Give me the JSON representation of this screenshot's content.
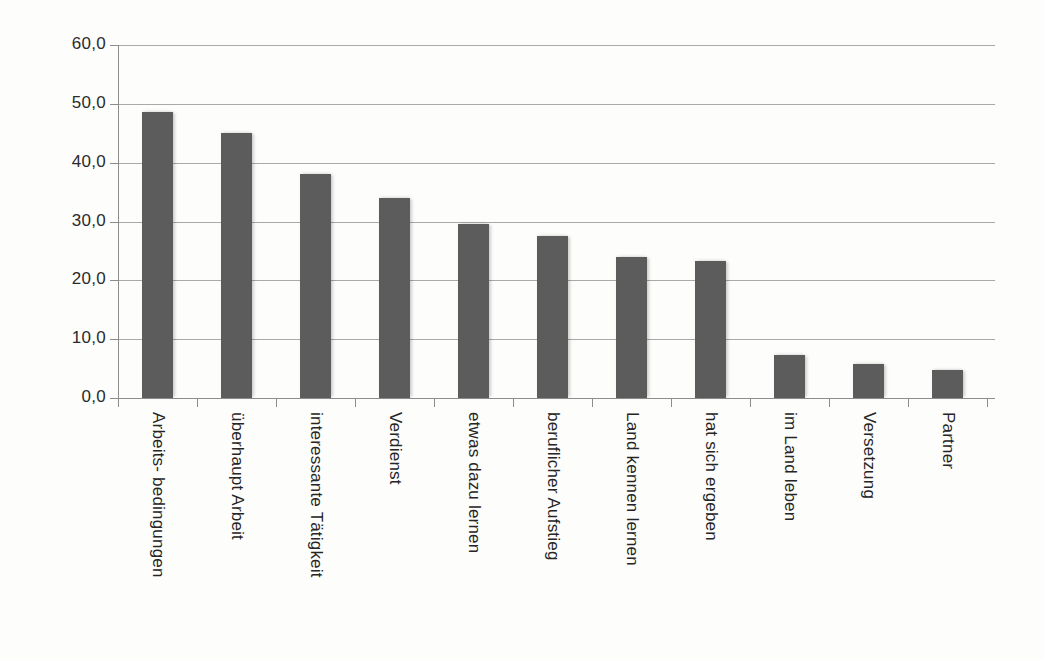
{
  "chart_data": {
    "type": "bar",
    "title": "",
    "subtitle": "",
    "xlabel": "",
    "ylabel": "",
    "ylim": [
      0,
      60
    ],
    "ytick_labels": [
      "0,0",
      "10,0",
      "20,0",
      "30,0",
      "40,0",
      "50,0",
      "60,0"
    ],
    "ytick_values": [
      0,
      10,
      20,
      30,
      40,
      50,
      60
    ],
    "grid": true,
    "legend": false,
    "legend_position": "none",
    "bar_color": "#5c5c5c",
    "gridline_color": "#a9a9a9",
    "axis_color": "#8d8d8d",
    "background_color": "#fdfdfc",
    "categories": [
      "Arbeits- bedingungen",
      "überhaupt Arbeit",
      "interessante Tätigkeit",
      "Verdienst",
      "etwas dazu lernen",
      "beruflicher Aufstieg",
      "Land kennen lernen",
      "hat sich ergeben",
      "im Land leben",
      "Versetzung",
      "Partner"
    ],
    "values": [
      48.6,
      45.0,
      38.0,
      34.0,
      29.5,
      27.5,
      24.0,
      23.3,
      7.3,
      5.8,
      4.8
    ]
  }
}
